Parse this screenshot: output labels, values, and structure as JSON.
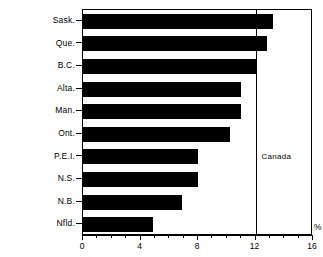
{
  "chart_data": {
    "type": "bar",
    "orientation": "horizontal",
    "title": "",
    "xlabel": "%",
    "ylabel": "",
    "categories": [
      "Sask.",
      "Que.",
      "B.C.",
      "Alta.",
      "Man.",
      "Ont.",
      "P.E.I.",
      "N.S.",
      "N.B.",
      "Nfld."
    ],
    "values": [
      13.2,
      12.8,
      12.0,
      11.0,
      11.0,
      10.2,
      8.0,
      8.0,
      6.9,
      4.9
    ],
    "xlim": [
      0,
      16
    ],
    "xticks": [
      0,
      4,
      8,
      12,
      16
    ],
    "xtick_labels": [
      "0",
      "4",
      "8",
      "12",
      "16"
    ],
    "minor_tick_step": 1,
    "grid": false,
    "legend": null,
    "bar_color": "#000000",
    "annotations": [
      {
        "name": "canada-reference-line",
        "label": "Canada",
        "value": 12.0,
        "type": "vline"
      }
    ]
  },
  "axis": {
    "unit_label": "%"
  }
}
